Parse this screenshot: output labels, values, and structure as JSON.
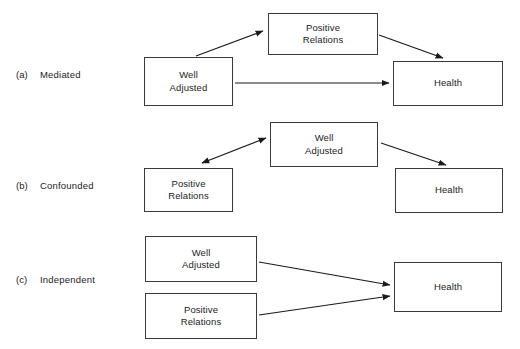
{
  "figure": {
    "type": "conceptual-path-diagram",
    "background_color": "#ffffff",
    "box_border_color": "#3a3a3a",
    "arrow_color": "#1a1a1a",
    "text_color": "#1c1c1c",
    "width": 520,
    "height": 349
  },
  "panels": [
    {
      "letter": "(a)",
      "title": "Mediated",
      "nodes": [
        {
          "id": "a-well-adjusted",
          "label": "Well\nAdjusted",
          "x": 144,
          "y": 57,
          "w": 89,
          "h": 49
        },
        {
          "id": "a-positive-relations",
          "label": "Positive\nRelations",
          "x": 268,
          "y": 13,
          "w": 110,
          "h": 42
        },
        {
          "id": "a-health",
          "label": "Health",
          "x": 393,
          "y": 61,
          "w": 110,
          "h": 45
        }
      ],
      "arrows": [
        {
          "id": "a-arrow-wa-to-pr",
          "from": "Well Adjusted",
          "to": "Positive Relations",
          "heads": "single"
        },
        {
          "id": "a-arrow-pr-to-health",
          "from": "Positive Relations",
          "to": "Health",
          "heads": "single"
        },
        {
          "id": "a-arrow-wa-to-health",
          "from": "Well Adjusted",
          "to": "Health",
          "heads": "single"
        }
      ]
    },
    {
      "letter": "(b)",
      "title": "Confounded",
      "nodes": [
        {
          "id": "b-positive-relations",
          "label": "Positive\nRelations",
          "x": 144,
          "y": 168,
          "w": 89,
          "h": 44
        },
        {
          "id": "b-well-adjusted",
          "label": "Well\nAdjusted",
          "x": 270,
          "y": 122,
          "w": 108,
          "h": 45
        },
        {
          "id": "b-health",
          "label": "Health",
          "x": 395,
          "y": 168,
          "w": 108,
          "h": 45
        }
      ],
      "arrows": [
        {
          "id": "b-arrow-wa-pr-double",
          "from": "Well Adjusted",
          "to": "Positive Relations",
          "heads": "double"
        },
        {
          "id": "b-arrow-wa-to-health",
          "from": "Well Adjusted",
          "to": "Health",
          "heads": "single"
        }
      ]
    },
    {
      "letter": "(c)",
      "title": "Independent",
      "nodes": [
        {
          "id": "c-well-adjusted",
          "label": "Well\nAdjusted",
          "x": 145,
          "y": 236,
          "w": 112,
          "h": 46
        },
        {
          "id": "c-positive-relations",
          "label": "Positive\nRelations",
          "x": 145,
          "y": 293,
          "w": 112,
          "h": 46
        },
        {
          "id": "c-health",
          "label": "Health",
          "x": 394,
          "y": 262,
          "w": 108,
          "h": 50
        }
      ],
      "arrows": [
        {
          "id": "c-arrow-wa-to-health",
          "from": "Well Adjusted",
          "to": "Health",
          "heads": "single"
        },
        {
          "id": "c-arrow-pr-to-health",
          "from": "Positive Relations",
          "to": "Health",
          "heads": "single"
        }
      ]
    }
  ],
  "label_positions": {
    "a_letter_x": 16,
    "a_letter_y": 76,
    "a_title_x": 40,
    "a_title_y": 76,
    "b_letter_x": 16,
    "b_letter_y": 187,
    "b_title_x": 40,
    "b_title_y": 187,
    "c_letter_x": 16,
    "c_letter_y": 281,
    "c_title_x": 40,
    "c_title_y": 281
  }
}
